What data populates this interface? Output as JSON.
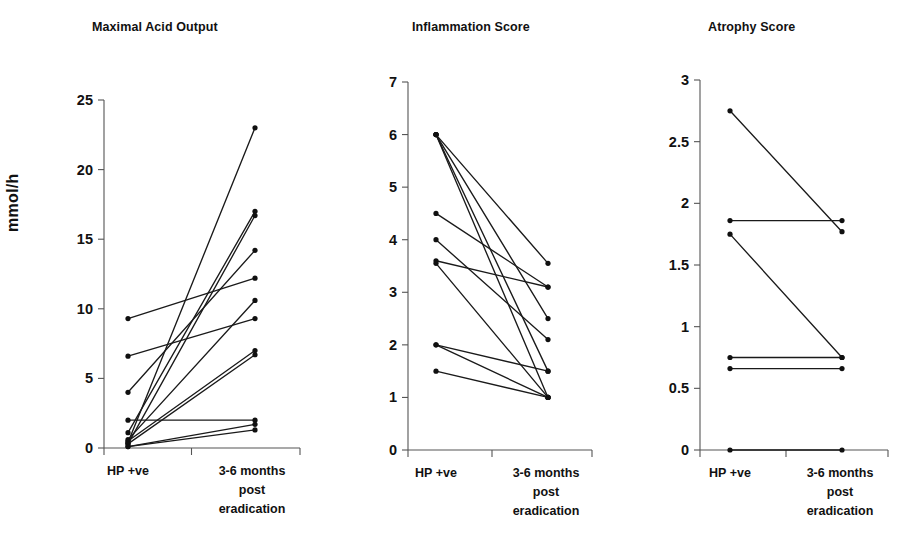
{
  "figure": {
    "kind": "paired-line-plots",
    "panel_count": 3,
    "shared_x_categories": [
      "HP +ve",
      "3-6 months post eradication"
    ],
    "x_label_line1": "3-6 months",
    "x_label_line2": "post",
    "x_label_line3": "eradication",
    "x_label_first": "HP +ve",
    "line_color": "#1a1a1a",
    "marker_color": "#101010",
    "axis_color": "#555555"
  },
  "chart_data": [
    {
      "type": "line",
      "title": "Maximal Acid Output",
      "xlabel": "",
      "ylabel": "mmol/h",
      "x": [
        "HP +ve",
        "3-6 months post eradication"
      ],
      "categories": [
        "HP +ve",
        "3-6 months post eradication"
      ],
      "ylim": [
        0,
        25
      ],
      "yticks": [
        0,
        5,
        10,
        15,
        20,
        25
      ],
      "ytick_labels": [
        "0",
        "5",
        "10",
        "15",
        "20",
        "25"
      ],
      "grid": false,
      "legend": "none",
      "paired": true,
      "series": [
        {
          "name": "subject-1",
          "values": [
            0.4,
            23.0
          ]
        },
        {
          "name": "subject-2",
          "values": [
            1.1,
            17.0
          ]
        },
        {
          "name": "subject-3",
          "values": [
            0.3,
            16.7
          ]
        },
        {
          "name": "subject-4",
          "values": [
            6.6,
            9.3
          ]
        },
        {
          "name": "subject-5",
          "values": [
            4.0,
            14.2
          ]
        },
        {
          "name": "subject-6",
          "values": [
            9.3,
            12.2
          ]
        },
        {
          "name": "subject-7",
          "values": [
            0.6,
            10.6
          ]
        },
        {
          "name": "subject-8",
          "values": [
            0.5,
            7.0
          ]
        },
        {
          "name": "subject-9",
          "values": [
            0.3,
            6.7
          ]
        },
        {
          "name": "subject-10",
          "values": [
            2.0,
            2.0
          ]
        },
        {
          "name": "subject-11",
          "values": [
            0.1,
            1.7
          ]
        },
        {
          "name": "subject-12",
          "values": [
            0.1,
            1.3
          ]
        }
      ]
    },
    {
      "type": "line",
      "title": "Inflammation Score",
      "xlabel": "",
      "ylabel": "",
      "x": [
        "HP +ve",
        "3-6 months post eradication"
      ],
      "categories": [
        "HP +ve",
        "3-6 months post eradication"
      ],
      "ylim": [
        0,
        7
      ],
      "yticks": [
        0,
        1,
        2,
        3,
        4,
        5,
        6,
        7
      ],
      "ytick_labels": [
        "0",
        "1",
        "2",
        "3",
        "4",
        "5",
        "6",
        "7"
      ],
      "grid": false,
      "legend": "none",
      "paired": true,
      "series": [
        {
          "name": "subject-1",
          "values": [
            6.0,
            3.55
          ]
        },
        {
          "name": "subject-2",
          "values": [
            6.0,
            2.5
          ]
        },
        {
          "name": "subject-3",
          "values": [
            6.0,
            1.5
          ]
        },
        {
          "name": "subject-4",
          "values": [
            6.0,
            1.0
          ]
        },
        {
          "name": "subject-5",
          "values": [
            4.5,
            3.1
          ]
        },
        {
          "name": "subject-6",
          "values": [
            4.0,
            2.1
          ]
        },
        {
          "name": "subject-7",
          "values": [
            3.6,
            3.1
          ]
        },
        {
          "name": "subject-8",
          "values": [
            3.55,
            1.0
          ]
        },
        {
          "name": "subject-9",
          "values": [
            2.0,
            1.5
          ]
        },
        {
          "name": "subject-10",
          "values": [
            2.0,
            1.0
          ]
        },
        {
          "name": "subject-11",
          "values": [
            1.5,
            1.0
          ]
        }
      ]
    },
    {
      "type": "line",
      "title": "Atrophy Score",
      "xlabel": "",
      "ylabel": "",
      "x": [
        "HP +ve",
        "3-6 months post eradication"
      ],
      "categories": [
        "HP +ve",
        "3-6 months post eradication"
      ],
      "ylim": [
        0,
        3
      ],
      "yticks": [
        0,
        0.5,
        1,
        1.5,
        2,
        2.5,
        3
      ],
      "ytick_labels": [
        "0",
        "0.5",
        "1",
        "1.5",
        "2",
        "2.5",
        "3"
      ],
      "grid": false,
      "legend": "none",
      "paired": true,
      "series": [
        {
          "name": "subject-1",
          "values": [
            2.75,
            1.77
          ]
        },
        {
          "name": "subject-2",
          "values": [
            1.86,
            1.86
          ]
        },
        {
          "name": "subject-3",
          "values": [
            1.75,
            0.75
          ]
        },
        {
          "name": "subject-4",
          "values": [
            0.75,
            0.75
          ]
        },
        {
          "name": "subject-5",
          "values": [
            0.66,
            0.66
          ]
        },
        {
          "name": "subject-6",
          "values": [
            0.0,
            0.0
          ]
        }
      ]
    }
  ]
}
